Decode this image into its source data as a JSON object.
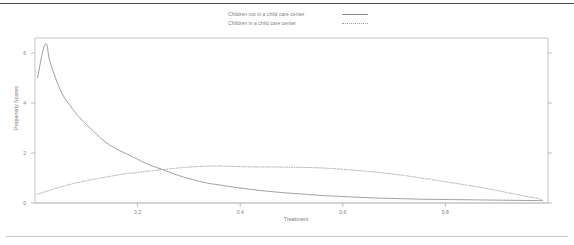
{
  "chart_data": {
    "type": "line",
    "title": "",
    "xlabel": "Treatment",
    "ylabel": "Propensity Scores",
    "xlim": [
      0.0,
      1.0
    ],
    "ylim": [
      0.0,
      6.6
    ],
    "grid": false,
    "legend_position": "top-center",
    "xticks": [
      "0.2",
      "0.4",
      "0.6",
      "0.8"
    ],
    "xtick_values": [
      0.2,
      0.4,
      0.6,
      0.8
    ],
    "yticks": [
      "0",
      "2",
      "4",
      "6"
    ],
    "ytick_values": [
      0,
      2,
      4,
      6
    ],
    "series": [
      {
        "name": "Children not in a child care center",
        "style": "solid",
        "color": "#8c8c8c",
        "x": [
          0.005,
          0.02,
          0.03,
          0.05,
          0.07,
          0.09,
          0.1,
          0.12,
          0.14,
          0.16,
          0.18,
          0.2,
          0.22,
          0.24,
          0.26,
          0.28,
          0.3,
          0.33,
          0.36,
          0.4,
          0.44,
          0.48,
          0.52,
          0.56,
          0.6,
          0.64,
          0.68,
          0.72,
          0.76,
          0.8,
          0.84,
          0.88,
          0.92,
          0.96,
          0.99
        ],
        "y": [
          5.0,
          6.35,
          5.6,
          4.5,
          3.85,
          3.35,
          3.15,
          2.75,
          2.4,
          2.15,
          1.95,
          1.75,
          1.55,
          1.4,
          1.25,
          1.1,
          0.98,
          0.82,
          0.72,
          0.6,
          0.5,
          0.42,
          0.36,
          0.3,
          0.26,
          0.22,
          0.19,
          0.17,
          0.15,
          0.14,
          0.13,
          0.12,
          0.11,
          0.1,
          0.1
        ]
      },
      {
        "name": "Children in a child care center",
        "style": "dotted",
        "color": "#a0a0a0",
        "x": [
          0.005,
          0.03,
          0.06,
          0.09,
          0.12,
          0.15,
          0.18,
          0.2,
          0.23,
          0.26,
          0.29,
          0.32,
          0.35,
          0.38,
          0.41,
          0.44,
          0.47,
          0.5,
          0.53,
          0.56,
          0.6,
          0.64,
          0.68,
          0.72,
          0.76,
          0.8,
          0.84,
          0.88,
          0.92,
          0.95,
          0.98,
          0.99
        ],
        "y": [
          0.35,
          0.52,
          0.7,
          0.85,
          0.97,
          1.08,
          1.18,
          1.22,
          1.3,
          1.36,
          1.42,
          1.46,
          1.48,
          1.47,
          1.45,
          1.44,
          1.44,
          1.43,
          1.42,
          1.4,
          1.35,
          1.28,
          1.2,
          1.1,
          0.98,
          0.85,
          0.72,
          0.58,
          0.42,
          0.3,
          0.18,
          0.12
        ]
      }
    ]
  },
  "legend": [
    {
      "label": "Children not in a child care center",
      "style": "solid"
    },
    {
      "label": "Children in a child care center",
      "style": "dotted"
    }
  ]
}
